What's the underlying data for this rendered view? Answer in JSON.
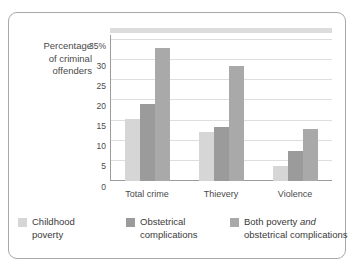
{
  "top_sliver_text": "",
  "axis_title": {
    "line1": "Percentage",
    "line2": "of criminal",
    "line3": "offenders"
  },
  "legend": {
    "items": [
      {
        "label_line1": "Childhood",
        "label_line2": "poverty",
        "color": "#d6d6d6"
      },
      {
        "label_line1": "Obstetrical",
        "label_line2": "complications",
        "color": "#9b9b9b"
      },
      {
        "label_line1_a": "Both poverty ",
        "label_line1_em": "and",
        "label_line2": "obstetrical complications",
        "color": "#a9a9a9"
      }
    ]
  },
  "chart_data": {
    "type": "bar",
    "title": "",
    "xlabel": "",
    "ylabel": "Percentage of criminal offenders",
    "ylim": [
      0,
      35
    ],
    "yticks": [
      "0",
      "5",
      "10",
      "15",
      "20",
      "25",
      "30",
      "35%"
    ],
    "ytick_values": [
      0,
      5,
      10,
      15,
      20,
      25,
      30,
      35
    ],
    "grid": true,
    "legend_position": "bottom",
    "categories": [
      "Total crime",
      "Thievery",
      "Violence"
    ],
    "series": [
      {
        "name": "Childhood poverty",
        "color": "#d6d6d6",
        "values": [
          15.5,
          12.2,
          3.7
        ]
      },
      {
        "name": "Obstetrical complications",
        "color": "#9b9b9b",
        "values": [
          19.0,
          13.4,
          7.5
        ]
      },
      {
        "name": "Both poverty and obstetrical complications",
        "color": "#a9a9a9",
        "values": [
          33.0,
          28.5,
          13.0
        ]
      }
    ]
  }
}
